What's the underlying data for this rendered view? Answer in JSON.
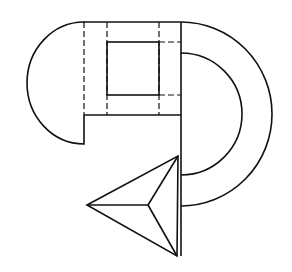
{
  "diagram": {
    "type": "geometric-line-drawing",
    "stroke_color": "#111111",
    "background": "#ffffff",
    "labels": []
  }
}
